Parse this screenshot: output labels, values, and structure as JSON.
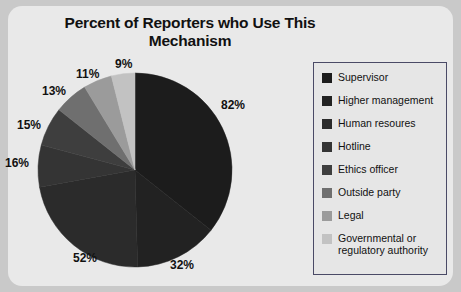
{
  "page": {
    "background_color": "#c9c9c9",
    "panel_color": "#e9e9e9"
  },
  "title": "Percent of Reporters who Use This Mechanism",
  "legend": {
    "border_color": "#4a4a66",
    "items": [
      {
        "label": "Supervisor",
        "color": "#1c1c1c"
      },
      {
        "label": "Higher management",
        "color": "#222222"
      },
      {
        "label": "Human resoures",
        "color": "#2b2b2b"
      },
      {
        "label": "Hotline",
        "color": "#343434"
      },
      {
        "label": "Ethics officer",
        "color": "#3e3e3e"
      },
      {
        "label": "Outside party",
        "color": "#6f6f6f"
      },
      {
        "label": "Legal",
        "color": "#9b9b9b"
      },
      {
        "label": "Governmental or regulatory authority",
        "color": "#c2c2c2"
      }
    ]
  },
  "chart_data": {
    "type": "pie",
    "title": "Percent of Reporters who Use This Mechanism",
    "xlabel": "",
    "ylabel": "",
    "units": "percent",
    "note": "Multiple-response survey: values sum to 220%, wedges drawn proportional to each value's share of the total.",
    "total": 220,
    "categories": [
      "Supervisor",
      "Higher management",
      "Human resoures",
      "Hotline",
      "Ethics officer",
      "Outside party",
      "Legal",
      "Governmental or regulatory authority"
    ],
    "values": [
      82,
      32,
      52,
      16,
      15,
      13,
      11,
      9
    ],
    "labels": [
      "82%",
      "32%",
      "52%",
      "16%",
      "15%",
      "13%",
      "11%",
      "9%"
    ],
    "colors": [
      "#1c1c1c",
      "#222222",
      "#2b2b2b",
      "#343434",
      "#3e3e3e",
      "#6f6f6f",
      "#9b9b9b",
      "#c2c2c2"
    ],
    "start_angle_deg": 0,
    "direction": "clockwise",
    "legend_position": "right",
    "grid": false
  },
  "geometry": {
    "center_x": 135,
    "center_y": 170,
    "radius": 97
  },
  "pct_labels": [
    {
      "text": "82%",
      "left": 221,
      "top": 98
    },
    {
      "text": "32%",
      "left": 170,
      "top": 258
    },
    {
      "text": "52%",
      "left": 73,
      "top": 251
    },
    {
      "text": "16%",
      "left": 5,
      "top": 156
    },
    {
      "text": "15%",
      "left": 17,
      "top": 118
    },
    {
      "text": "13%",
      "left": 42,
      "top": 84
    },
    {
      "text": "11%",
      "left": 76,
      "top": 67
    },
    {
      "text": "9%",
      "left": 115,
      "top": 57
    }
  ]
}
